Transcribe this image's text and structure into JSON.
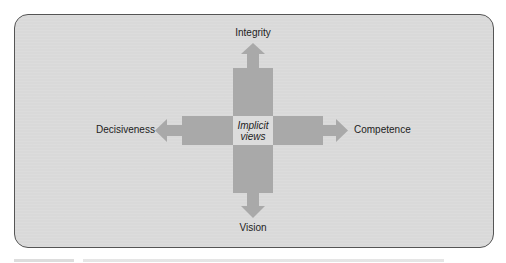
{
  "diagram": {
    "center_label": [
      "Implicit",
      "views"
    ],
    "directions": {
      "top": "Integrity",
      "bottom": "Vision",
      "left": "Decisiveness",
      "right": "Competence"
    }
  },
  "colors": {
    "panel_bg": "#d9d9d9",
    "bars": "#a9a9a9",
    "center": "#dcdcdc",
    "border": "#555555"
  }
}
